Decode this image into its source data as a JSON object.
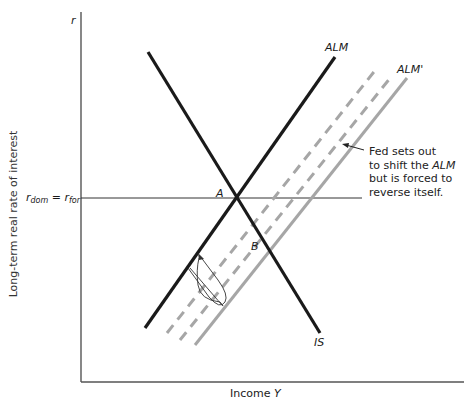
{
  "diagram": {
    "axes": {
      "y_label": "Long-term real rate of interest",
      "y_symbol": "r",
      "x_label": "Income Y",
      "x_label_text": "Income ",
      "x_label_var": "Y"
    },
    "horizontal_line": {
      "label_r": "r",
      "label_dom": "dom",
      "label_eq": " = ",
      "label_for": "for",
      "full_label": "r_dom = r_for"
    },
    "curves": [
      {
        "name": "ALM",
        "label": "ALM",
        "style": "solid",
        "color": "#1a1a1a"
      },
      {
        "name": "IS",
        "label": "IS",
        "style": "solid",
        "color": "#1a1a1a"
      },
      {
        "name": "ALM-intermediate-1",
        "label": "",
        "style": "dashed",
        "color": "#a6a6a6"
      },
      {
        "name": "ALM-intermediate-2",
        "label": "",
        "style": "dashed",
        "color": "#a6a6a6"
      },
      {
        "name": "ALM'",
        "label": "ALM'",
        "style": "solid",
        "color": "#a6a6a6"
      }
    ],
    "points": [
      {
        "label": "A"
      },
      {
        "label": "B"
      }
    ],
    "annotation": {
      "line1": "Fed sets out",
      "line2_pre": "to shift the ",
      "line2_it": "ALM",
      "line3": "but is forced to",
      "line4": "reverse itself."
    }
  }
}
